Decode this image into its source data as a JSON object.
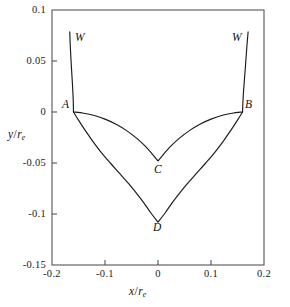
{
  "chart_data": {
    "type": "line",
    "title": "",
    "xlabel": "x/r_e",
    "ylabel": "y/r_e",
    "xlim": [
      -0.2,
      0.2
    ],
    "ylim": [
      -0.15,
      0.1
    ],
    "grid": false,
    "legend": "none",
    "x_ticks": [
      "-0.2",
      "-0.1",
      "0",
      "0.1",
      "0.2"
    ],
    "x_tick_values": [
      -0.2,
      -0.1,
      0,
      0.1,
      0.2
    ],
    "y_ticks": [
      "0.1",
      "0.05",
      "0",
      "-0.05",
      "-0.1",
      "-0.15"
    ],
    "y_tick_values": [
      0.1,
      0.05,
      0,
      -0.05,
      -0.1,
      -0.15
    ],
    "annotations": [
      {
        "label": "W",
        "x": -0.16,
        "y": 0.079
      },
      {
        "label": "W",
        "x": 0.163,
        "y": 0.079
      },
      {
        "label": "A",
        "x": -0.16,
        "y": 0.0
      },
      {
        "label": "B",
        "x": 0.16,
        "y": 0.0
      },
      {
        "label": "C",
        "x": 0.0,
        "y": -0.048
      },
      {
        "label": "D",
        "x": 0.0,
        "y": -0.108
      }
    ],
    "series": [
      {
        "name": "left-wall",
        "points": [
          [
            -0.1665,
            0.0785
          ],
          [
            -0.1655,
            0.065
          ],
          [
            -0.1635,
            0.045
          ],
          [
            -0.1615,
            0.028
          ],
          [
            -0.16,
            0.0125
          ],
          [
            -0.1595,
            0.0
          ]
        ]
      },
      {
        "name": "right-wall",
        "points": [
          [
            0.1595,
            0.0
          ],
          [
            0.1605,
            0.0125
          ],
          [
            0.1625,
            0.028
          ],
          [
            0.165,
            0.045
          ],
          [
            0.1678,
            0.065
          ],
          [
            0.17,
            0.0785
          ]
        ]
      },
      {
        "name": "upper-curve-ACB",
        "points": [
          [
            -0.1595,
            0.0
          ],
          [
            -0.14,
            -0.0012
          ],
          [
            -0.12,
            -0.0035
          ],
          [
            -0.1,
            -0.007
          ],
          [
            -0.08,
            -0.0118
          ],
          [
            -0.06,
            -0.018
          ],
          [
            -0.04,
            -0.0258
          ],
          [
            -0.025,
            -0.033
          ],
          [
            -0.012,
            -0.0405
          ],
          [
            0.0,
            -0.048
          ],
          [
            0.012,
            -0.0405
          ],
          [
            0.025,
            -0.033
          ],
          [
            0.04,
            -0.0258
          ],
          [
            0.06,
            -0.018
          ],
          [
            0.08,
            -0.0118
          ],
          [
            0.1,
            -0.007
          ],
          [
            0.12,
            -0.0035
          ],
          [
            0.14,
            -0.0012
          ],
          [
            0.1595,
            0.0
          ]
        ]
      },
      {
        "name": "lower-curve-ADB",
        "points": [
          [
            -0.1595,
            0.0
          ],
          [
            -0.15,
            -0.008
          ],
          [
            -0.138,
            -0.0175
          ],
          [
            -0.124,
            -0.028
          ],
          [
            -0.108,
            -0.039
          ],
          [
            -0.09,
            -0.05
          ],
          [
            -0.072,
            -0.0605
          ],
          [
            -0.055,
            -0.0705
          ],
          [
            -0.04,
            -0.08
          ],
          [
            -0.026,
            -0.0895
          ],
          [
            -0.014,
            -0.0985
          ],
          [
            0.0,
            -0.108
          ],
          [
            0.014,
            -0.0985
          ],
          [
            0.026,
            -0.0895
          ],
          [
            0.04,
            -0.08
          ],
          [
            0.055,
            -0.0705
          ],
          [
            0.072,
            -0.0605
          ],
          [
            0.09,
            -0.05
          ],
          [
            0.108,
            -0.039
          ],
          [
            0.124,
            -0.028
          ],
          [
            0.138,
            -0.0175
          ],
          [
            0.15,
            -0.008
          ],
          [
            0.1595,
            0.0
          ]
        ]
      }
    ]
  },
  "axis_titles": {
    "x_var": "x",
    "x_den": "r",
    "x_sub": "e",
    "y_var": "y",
    "y_den": "r",
    "y_sub": "e",
    "slash": "/"
  },
  "style": {
    "line_color": "#1a1a1a",
    "axis_color": "#555555",
    "background": "#ffffff"
  }
}
